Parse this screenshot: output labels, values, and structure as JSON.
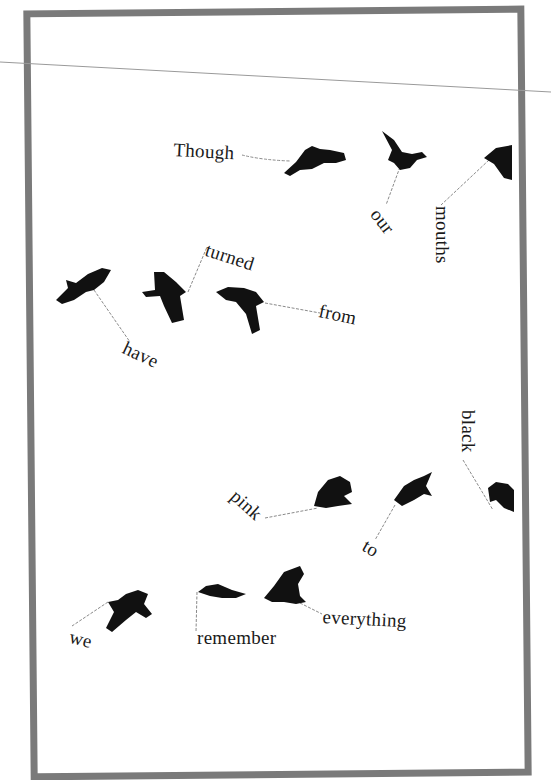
{
  "poem": {
    "title": "",
    "words": [
      {
        "id": "w1",
        "text": "Though",
        "x": 174,
        "y": 140,
        "rot": 3
      },
      {
        "id": "w2",
        "text": "our",
        "x": 382,
        "y": 206,
        "rot": 52
      },
      {
        "id": "w3",
        "text": "mouths",
        "x": 446,
        "y": 206,
        "rot": 90
      },
      {
        "id": "w4",
        "text": "turned",
        "x": 209,
        "y": 240,
        "rot": 18
      },
      {
        "id": "w5",
        "text": "from",
        "x": 320,
        "y": 302,
        "rot": 12
      },
      {
        "id": "w6",
        "text": "have",
        "x": 127,
        "y": 340,
        "rot": 25
      },
      {
        "id": "w7",
        "text": "black",
        "x": 477,
        "y": 411,
        "rot": 90
      },
      {
        "id": "w8",
        "text": "pink",
        "x": 239,
        "y": 487,
        "rot": 42
      },
      {
        "id": "w9",
        "text": "to",
        "x": 368,
        "y": 538,
        "rot": 30
      },
      {
        "id": "w10",
        "text": "we",
        "x": 73,
        "y": 628,
        "rot": 14
      },
      {
        "id": "w11",
        "text": "remember",
        "x": 196,
        "y": 628,
        "rot": 0
      },
      {
        "id": "w12",
        "text": "everything",
        "x": 322,
        "y": 608,
        "rot": 3
      }
    ]
  },
  "birds_count": 14,
  "colors": {
    "frame": "#7a7a7a",
    "ink": "#1a1a1a",
    "line": "#9a9a9a",
    "background": "#ffffff"
  }
}
